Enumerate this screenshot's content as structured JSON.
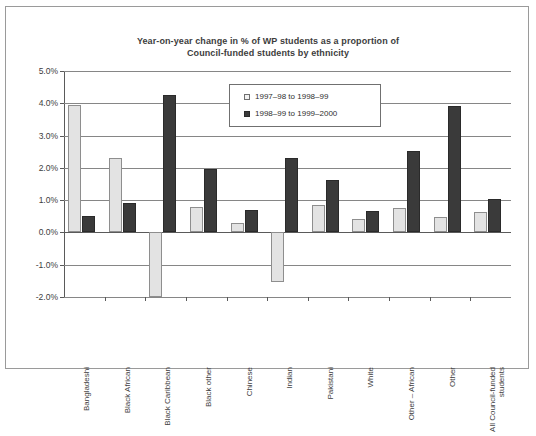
{
  "chart_data": {
    "type": "bar",
    "title": "Year-on-year change in % of WP students as a proportion of Council-funded students by ethnicity",
    "title_line1": "Year-on-year change in % of WP students as a proportion of",
    "title_line2": "Council-funded students by ethnicity",
    "xlabel": "",
    "ylabel": "",
    "ylim": [
      -2.0,
      5.0
    ],
    "ytick_labels": [
      "5.0%",
      "4.0%",
      "3.0%",
      "2.0%",
      "1.0%",
      "0.0%",
      "-1.0%",
      "-2.0%"
    ],
    "ytick_values": [
      5.0,
      4.0,
      3.0,
      2.0,
      1.0,
      0.0,
      -1.0,
      -2.0
    ],
    "grid": true,
    "legend_position": "top-center",
    "categories": [
      "Bangladeshi",
      "Black African",
      "Black Caribbean",
      "Black other",
      "Chinese",
      "Indian",
      "Pakistani",
      "White",
      "Other – African",
      "Other",
      "All Council-funded students"
    ],
    "series": [
      {
        "name": "1997–98 to 1998–99",
        "color": "#e3e3e3",
        "values": [
          3.95,
          2.3,
          -2.0,
          0.78,
          0.3,
          -1.55,
          0.86,
          0.42,
          0.77,
          0.48,
          0.64
        ]
      },
      {
        "name": "1998–99 to 1999–2000",
        "color": "#3a3a3a",
        "values": [
          0.51,
          0.92,
          4.25,
          1.98,
          0.69,
          2.29,
          1.63,
          0.65,
          2.52,
          3.91,
          1.04
        ]
      }
    ]
  },
  "legend": {
    "items": [
      {
        "label": "1997–98 to 1998–99"
      },
      {
        "label": "1998–99 to 1999–2000"
      }
    ]
  }
}
